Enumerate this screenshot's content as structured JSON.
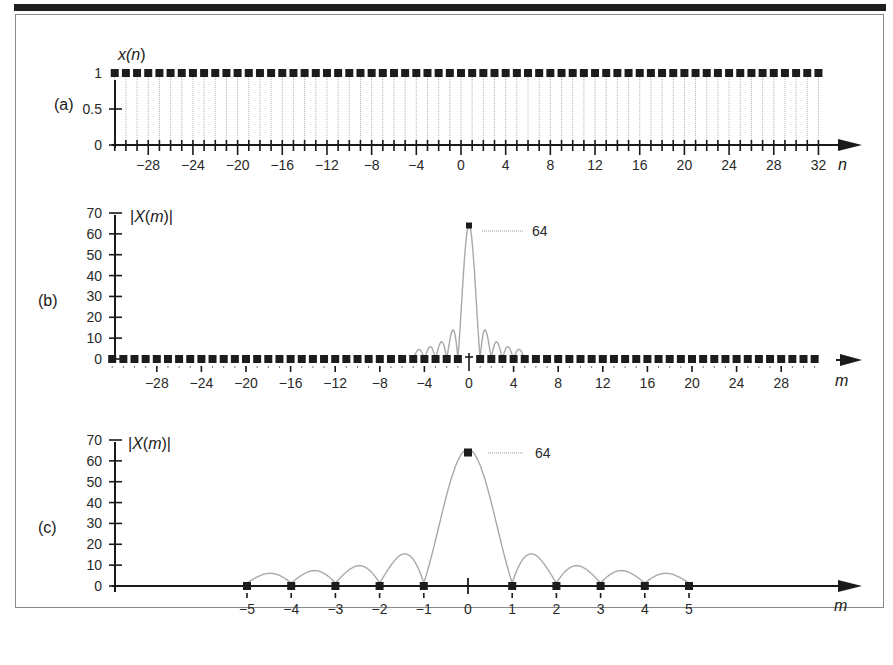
{
  "figure": {
    "panels": [
      {
        "label": "(a)",
        "y_title_pre": "x(",
        "y_title_var": "n",
        "y_title_post": ")",
        "x_title": "n",
        "y_ticks": [
          "1",
          "0.5",
          "0"
        ],
        "x_tick_labels": [
          "-28",
          "-24",
          "-20",
          "-16",
          "-12",
          "-8",
          "-4",
          "0",
          "4",
          "8",
          "12",
          "16",
          "20",
          "24",
          "28",
          "32"
        ]
      },
      {
        "label": "(b)",
        "y_title": "|X(m)|",
        "x_title": "m",
        "y_ticks": [
          "70",
          "60",
          "50",
          "40",
          "30",
          "20",
          "10",
          "0"
        ],
        "x_tick_labels": [
          "-28",
          "-24",
          "-20",
          "-16",
          "-12",
          "-8",
          "-4",
          "0",
          "4",
          "8",
          "12",
          "16",
          "20",
          "24",
          "28"
        ],
        "peak_annotation": "64"
      },
      {
        "label": "(c)",
        "y_title": "|X(m)|",
        "x_title": "m",
        "y_ticks": [
          "70",
          "60",
          "50",
          "40",
          "30",
          "20",
          "10",
          "0"
        ],
        "x_tick_labels": [
          "-5",
          "-4",
          "-3",
          "-2",
          "-1",
          "0",
          "1",
          "2",
          "3",
          "4",
          "5"
        ],
        "peak_annotation": "64"
      }
    ]
  },
  "chart_data": [
    {
      "type": "scatter",
      "title": "(a)",
      "xlabel": "n",
      "ylabel": "x(n)",
      "x_range": [
        -31,
        32
      ],
      "ylim": [
        0,
        1
      ],
      "y_ticks": [
        0,
        0.5,
        1
      ],
      "x_ticks": [
        -28,
        -24,
        -20,
        -16,
        -12,
        -8,
        -4,
        0,
        4,
        8,
        12,
        16,
        20,
        24,
        28,
        32
      ],
      "series": [
        {
          "name": "x(n)",
          "x": "n = -31 ... 32 (64 samples)",
          "value": 1,
          "style": "stem"
        }
      ],
      "grid": false
    },
    {
      "type": "line",
      "title": "(b)",
      "xlabel": "m",
      "ylabel": "|X(m)|",
      "ylim": [
        0,
        70
      ],
      "y_ticks": [
        0,
        10,
        20,
        30,
        40,
        50,
        60,
        70
      ],
      "x_ticks": [
        -28,
        -24,
        -20,
        -16,
        -12,
        -8,
        -4,
        0,
        4,
        8,
        12,
        16,
        20,
        24,
        28
      ],
      "series": [
        {
          "name": "DFT samples |X(m)|",
          "x": "m = -31 ... 31",
          "values_note": "64 at m=0, 0 elsewhere"
        },
        {
          "name": "continuous spectrum (sinc envelope, gray)",
          "mainlobe_peak": 64,
          "sidelobe_peaks": [
            14.5,
            9.2,
            7.2,
            6.5
          ],
          "support": [
            -5,
            5
          ]
        }
      ],
      "annotations": [
        {
          "text": "64",
          "at": [
            0,
            64
          ]
        }
      ],
      "grid": false
    },
    {
      "type": "line",
      "title": "(c)",
      "xlabel": "m",
      "ylabel": "|X(m)|",
      "ylim": [
        0,
        70
      ],
      "y_ticks": [
        0,
        10,
        20,
        30,
        40,
        50,
        60,
        70
      ],
      "x_ticks": [
        -5,
        -4,
        -3,
        -2,
        -1,
        0,
        1,
        2,
        3,
        4,
        5
      ],
      "categories": [
        -5,
        -4,
        -3,
        -2,
        -1,
        0,
        1,
        2,
        3,
        4,
        5
      ],
      "series": [
        {
          "name": "DFT samples |X(m)|",
          "values": [
            0,
            0,
            0,
            0,
            0,
            64,
            0,
            0,
            0,
            0,
            0
          ]
        },
        {
          "name": "continuous spectrum (gray)",
          "mainlobe_peak": 64,
          "sidelobe_peaks": [
            14.5,
            9.2,
            7.2,
            6.5
          ]
        }
      ],
      "annotations": [
        {
          "text": "64",
          "at": [
            0,
            64
          ]
        }
      ],
      "grid": false
    }
  ]
}
